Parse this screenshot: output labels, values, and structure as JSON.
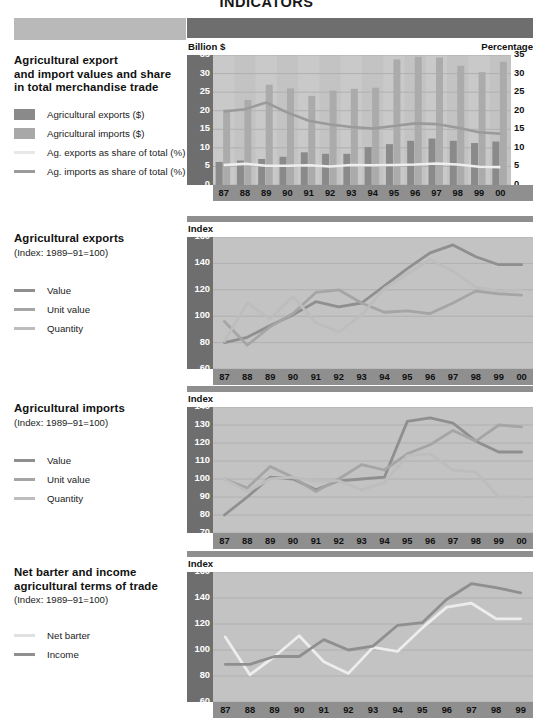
{
  "document": {
    "title": "INDICATORS"
  },
  "panels": [
    {
      "id": "trade-values",
      "side": {
        "title_lines": [
          "Agricultural export",
          "and import values and share",
          "in total merchandise trade"
        ],
        "subtitle": "",
        "legend": [
          {
            "label": "Agricultural exports ($)",
            "type": "box",
            "color": "#8a8a8a"
          },
          {
            "label": "Agricultural imports ($)",
            "type": "box",
            "color": "#a8a8a8"
          },
          {
            "label": "Ag. exports as share of total (%)",
            "type": "line",
            "color": "#e8e8e8"
          },
          {
            "label": "Ag. imports as share of total (%)",
            "type": "line",
            "color": "#9a9a9a"
          }
        ]
      },
      "unit_left": "Billion $",
      "unit_right": "Percentage",
      "chart_data": {
        "type": "bar",
        "title": "Agricultural export and import values and share in total merchandise trade",
        "xlabel": "",
        "ylabel": "Billion $",
        "y2label": "Percentage",
        "ylim": [
          0,
          35
        ],
        "y2lim": [
          0,
          35
        ],
        "yticks": [
          0,
          5,
          10,
          15,
          20,
          25,
          30,
          35
        ],
        "y2ticks": [
          0,
          5,
          10,
          15,
          20,
          25,
          30,
          35
        ],
        "grid": true,
        "legend_position": "external-left",
        "categories": [
          "87",
          "88",
          "89",
          "90",
          "91",
          "92",
          "93",
          "94",
          "95",
          "96",
          "97",
          "98",
          "99",
          "00"
        ],
        "series": [
          {
            "name": "Agricultural exports ($)",
            "kind": "bar",
            "color": "#8a8a8a",
            "axis": "left",
            "values": [
              6.2,
              6.6,
              7.0,
              7.6,
              8.8,
              8.4,
              8.4,
              10.2,
              11.0,
              11.9,
              12.5,
              11.9,
              11.3,
              11.7
            ]
          },
          {
            "name": "Agricultural imports ($)",
            "kind": "bar",
            "color": "#ababab",
            "axis": "left",
            "values": [
              20.3,
              22.9,
              27.0,
              26.0,
              24.0,
              25.4,
              25.9,
              26.2,
              33.8,
              34.5,
              34.3,
              32.1,
              30.4,
              33.2
            ]
          },
          {
            "name": "Ag. exports as share of total (%)",
            "kind": "line",
            "color": "#efefef",
            "axis": "right",
            "values": [
              5.4,
              5.7,
              5.2,
              5.2,
              5.3,
              5.0,
              5.4,
              5.3,
              5.4,
              5.5,
              5.8,
              5.5,
              4.9,
              4.8
            ]
          },
          {
            "name": "Ag. imports as share of total (%)",
            "kind": "line",
            "color": "#9a9a9a",
            "axis": "right",
            "values": [
              19.8,
              20.4,
              22.2,
              19.5,
              17.3,
              16.3,
              15.6,
              15.2,
              15.9,
              16.6,
              16.4,
              15.4,
              14.2,
              13.8
            ]
          }
        ]
      }
    },
    {
      "id": "ag-exports-index",
      "side": {
        "title_lines": [
          "Agricultural exports"
        ],
        "subtitle": "(Index: 1989–91=100)",
        "legend": [
          {
            "label": "Value",
            "type": "line",
            "color": "#8f8f8f"
          },
          {
            "label": "Unit value",
            "type": "line",
            "color": "#a5a5a5"
          },
          {
            "label": "Quantity",
            "type": "line",
            "color": "#bdbdbd"
          }
        ]
      },
      "unit_left": "Index",
      "unit_right": "",
      "chart_data": {
        "type": "line",
        "title": "Agricultural exports (Index: 1989–91=100)",
        "xlabel": "",
        "ylabel": "Index",
        "ylim": [
          60,
          160
        ],
        "yticks": [
          60,
          80,
          100,
          120,
          140,
          160
        ],
        "grid": true,
        "legend_position": "external-left",
        "categories": [
          "87",
          "88",
          "89",
          "90",
          "91",
          "92",
          "93",
          "94",
          "95",
          "96",
          "97",
          "98",
          "99",
          "00"
        ],
        "series": [
          {
            "name": "Value",
            "color": "#8f8f8f",
            "values": [
              80,
              84,
              93,
              101,
              111,
              107,
              110,
              123,
              136,
              148,
              154,
              145,
              139,
              139
            ]
          },
          {
            "name": "Unit value",
            "color": "#a5a5a5",
            "values": [
              96,
              78,
              92,
              102,
              118,
              120,
              110,
              103,
              104,
              102,
              110,
              119,
              117,
              116
            ]
          },
          {
            "name": "Quantity",
            "color": "#bdbdbd",
            "values": [
              81,
              110,
              98,
              115,
              95,
              88,
              101,
              121,
              132,
              143,
              134,
              122,
              119,
              120
            ]
          }
        ]
      }
    },
    {
      "id": "ag-imports-index",
      "side": {
        "title_lines": [
          "Agricultural imports"
        ],
        "subtitle": "(Index: 1989–91=100)",
        "legend": [
          {
            "label": "Value",
            "type": "line",
            "color": "#8f8f8f"
          },
          {
            "label": "Unit value",
            "type": "line",
            "color": "#a5a5a5"
          },
          {
            "label": "Quantity",
            "type": "line",
            "color": "#bdbdbd"
          }
        ]
      },
      "unit_left": "Index",
      "unit_right": "",
      "chart_data": {
        "type": "line",
        "title": "Agricultural imports (Index: 1989–91=100)",
        "xlabel": "",
        "ylabel": "Index",
        "ylim": [
          70,
          140
        ],
        "yticks": [
          70,
          80,
          90,
          100,
          110,
          120,
          130,
          140
        ],
        "grid": true,
        "legend_position": "external-left",
        "categories": [
          "87",
          "88",
          "89",
          "90",
          "91",
          "92",
          "93",
          "94",
          "95",
          "96",
          "97",
          "98",
          "99",
          "00"
        ],
        "series": [
          {
            "name": "Value",
            "color": "#8f8f8f",
            "values": [
              80,
              90,
              101,
              100,
              94,
              99,
              100,
              101,
              132,
              134,
              131,
              121,
              115,
              115
            ]
          },
          {
            "name": "Unit value",
            "color": "#a5a5a5",
            "values": [
              100,
              95,
              107,
              101,
              93,
              100,
              108,
              105,
              114,
              119,
              127,
              121,
              130,
              129
            ]
          },
          {
            "name": "Quantity",
            "color": "#bdbdbd",
            "values": [
              100,
              93,
              100,
              101,
              99,
              99,
              94,
              98,
              113,
              114,
              105,
              104,
              90,
              90
            ]
          }
        ]
      }
    },
    {
      "id": "terms-of-trade",
      "side": {
        "title_lines": [
          "Net barter and income",
          "agricultural terms of trade"
        ],
        "subtitle": "(Index: 1989–91=100)",
        "legend": [
          {
            "label": "Net barter",
            "type": "line",
            "color": "#e0e0e0"
          },
          {
            "label": "Income",
            "type": "line",
            "color": "#8f8f8f"
          }
        ]
      },
      "unit_left": "Index",
      "unit_right": "",
      "chart_data": {
        "type": "line",
        "title": "Net barter and income agricultural terms of trade (Index: 1989–91=100)",
        "xlabel": "",
        "ylabel": "Index",
        "ylim": [
          60,
          160
        ],
        "yticks": [
          60,
          80,
          100,
          120,
          140,
          160
        ],
        "grid": true,
        "legend_position": "external-left",
        "categories": [
          "87",
          "88",
          "89",
          "90",
          "91",
          "92",
          "93",
          "94",
          "95",
          "96",
          "97",
          "98",
          "99"
        ],
        "series": [
          {
            "name": "Net barter",
            "color": "#ededed",
            "values": [
              110,
              81,
              95,
              111,
              91,
              82,
              102,
              99,
              117,
              133,
              136,
              124,
              124
            ]
          },
          {
            "name": "Income",
            "color": "#8f8f8f",
            "values": [
              89,
              89,
              95,
              95,
              108,
              100,
              103,
              119,
              121,
              139,
              151,
              148,
              144
            ]
          }
        ]
      }
    }
  ]
}
